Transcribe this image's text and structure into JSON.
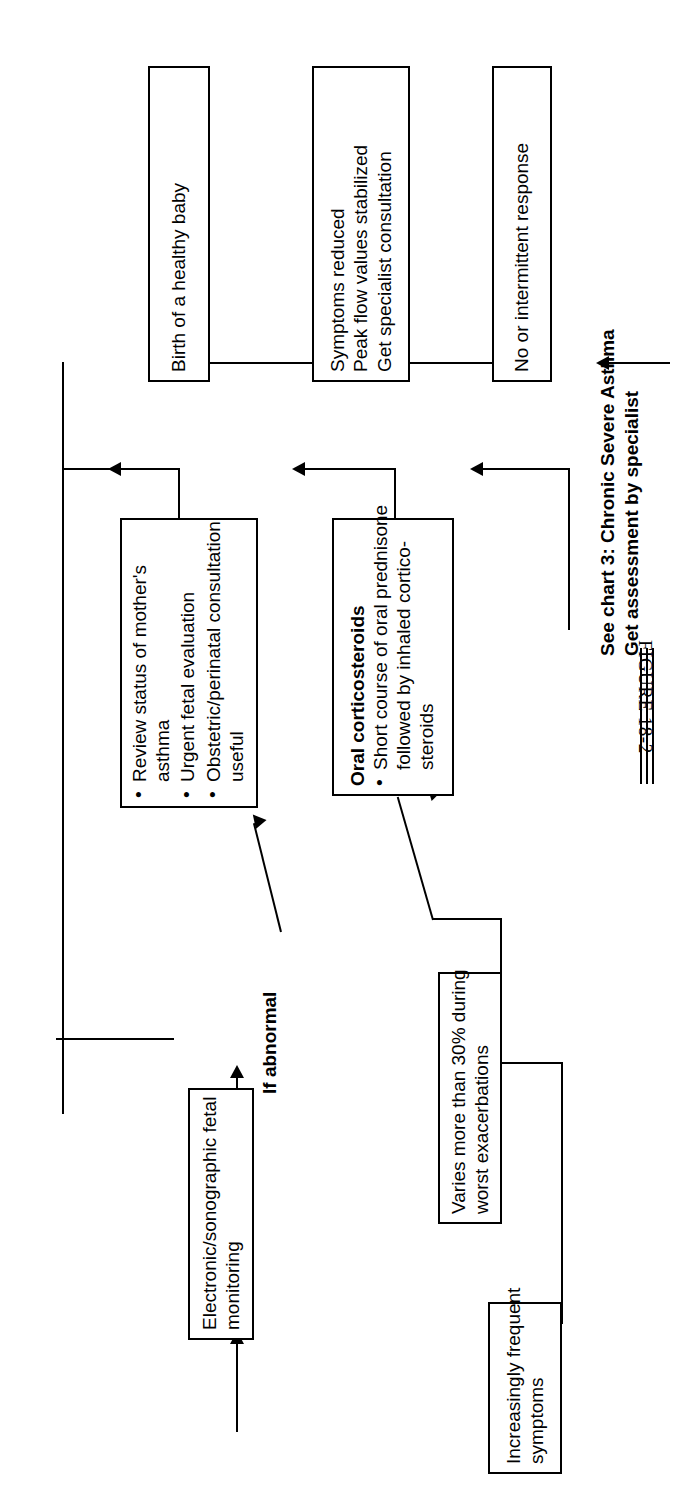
{
  "figure": {
    "caption": "FIGURE 18-2",
    "orientation": "rotated-90-ccw"
  },
  "nodes": {
    "increasingly_frequent": {
      "text_lines": [
        "Increasingly frequent",
        "symptoms"
      ]
    },
    "varies_more_than_30": {
      "text_lines": [
        "Varies more than 30% during",
        "worst exacerbations"
      ]
    },
    "fetal_monitoring": {
      "text_lines": [
        "Electronic/sonographic fetal",
        "monitoring"
      ]
    },
    "review_status": {
      "bullets": [
        [
          "Review status of mother's",
          "asthma"
        ],
        [
          "Urgent fetal evaluation"
        ],
        [
          "Obstetric/perinatal consultation",
          "useful"
        ]
      ]
    },
    "oral_corticosteroids": {
      "heading": "Oral corticosteroids",
      "bullets": [
        [
          "Short course of oral prednisone",
          "followed by inhaled cortico-",
          "steroids"
        ]
      ]
    },
    "birth_healthy_baby": {
      "text_lines": [
        "Birth of a healthy baby"
      ]
    },
    "symptoms_reduced": {
      "text_lines": [
        "Symptoms reduced",
        "Peak flow values stabilized",
        "Get specialist consultation"
      ]
    },
    "no_or_intermittent": {
      "text_lines": [
        "No or intermittent response"
      ]
    }
  },
  "labels": {
    "if_abnormal": "If abnormal",
    "see_chart_3": [
      "See chart 3: Chronic Severe Asthma",
      "Get assessment by specialist"
    ]
  },
  "colors": {
    "ink": "#000000",
    "paper": "#ffffff"
  }
}
